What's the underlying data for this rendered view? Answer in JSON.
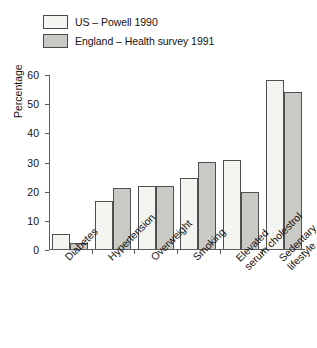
{
  "chart_data": {
    "type": "bar",
    "title": "",
    "xlabel": "",
    "ylabel": "Percentage",
    "ylim": [
      0,
      60
    ],
    "ytick_step": 10,
    "yticks": [
      0,
      10,
      20,
      30,
      40,
      50,
      60
    ],
    "grid": false,
    "legend_position": "top-left",
    "categories": [
      "Diabetes",
      "Hypertension",
      "Overweight",
      "Smoking",
      "Elevated serum cholestrol",
      "Sedentary lifestyle"
    ],
    "category_lines": [
      [
        "Diabetes"
      ],
      [
        "Hypertension"
      ],
      [
        "Overweight"
      ],
      [
        "Smoking"
      ],
      [
        "Elevated",
        "serum cholestrol"
      ],
      [
        "Sedentary",
        "lifestyle"
      ]
    ],
    "series": [
      {
        "name": "US – Powell 1990",
        "color": "#f4f4f1",
        "values": [
          5,
          16.5,
          21.5,
          24.5,
          30.5,
          58
        ]
      },
      {
        "name": "England – Health survey 1991",
        "color": "#c9c9c6",
        "values": [
          2,
          21,
          21.5,
          30,
          19.5,
          54
        ]
      }
    ]
  },
  "legend": {
    "items": [
      {
        "label": "US – Powell 1990",
        "swatch": "#f4f4f1"
      },
      {
        "label": "England – Health survey 1991",
        "swatch": "#c9c9c6"
      }
    ]
  },
  "axis": {
    "y_title": "Percentage",
    "y_tick_labels": [
      "60",
      "50",
      "40",
      "30",
      "20",
      "10",
      "0"
    ]
  },
  "colors": {
    "series_us": "#f4f4f1",
    "series_england": "#c9c9c6",
    "bar_outline": "#4f4f4f",
    "axis": "#5c5c5c",
    "text": "#16120f",
    "background": "#ffffff"
  }
}
